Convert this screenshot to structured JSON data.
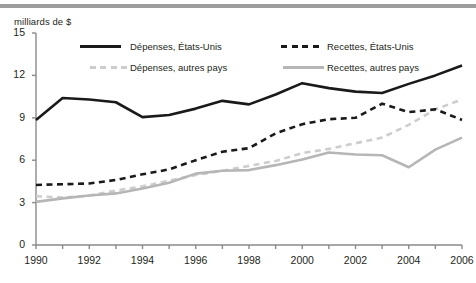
{
  "chart_data": {
    "type": "line",
    "title": "",
    "subtitle": "",
    "ylabel": "milliards de $",
    "xlabel": "",
    "ylim": [
      0,
      15
    ],
    "xlim": [
      1990,
      2006
    ],
    "yticks": [
      0,
      3,
      6,
      9,
      12,
      15
    ],
    "xticks": [
      1990,
      1991,
      1992,
      1993,
      1994,
      1995,
      1996,
      1997,
      1998,
      1999,
      2000,
      2001,
      2002,
      2003,
      2004,
      2005,
      2006
    ],
    "xtick_labels": [
      "1990",
      "1992",
      "1994",
      "1996",
      "1998",
      "2000",
      "2002",
      "2004",
      "2006"
    ],
    "ytick_labels": [
      "0",
      "3",
      "6",
      "9",
      "12",
      "15"
    ],
    "grid": false,
    "legend_position": "top-inside",
    "x": [
      1990,
      1991,
      1992,
      1993,
      1994,
      1995,
      1996,
      1997,
      1998,
      1999,
      2000,
      2001,
      2002,
      2003,
      2004,
      2005,
      2006
    ],
    "series": [
      {
        "name": "Dépenses, États-Unis",
        "style": "solid",
        "color": "#1a1a1a",
        "width": 2.6,
        "values": [
          8.85,
          10.4,
          10.3,
          10.1,
          9.05,
          9.2,
          9.65,
          10.2,
          9.95,
          10.65,
          11.45,
          11.1,
          10.85,
          10.75,
          11.4,
          12.0,
          12.7
        ]
      },
      {
        "name": "Recettes, États-Unis",
        "style": "dashed",
        "color": "#1a1a1a",
        "width": 2.6,
        "values": [
          4.25,
          4.3,
          4.35,
          4.6,
          5.0,
          5.35,
          6.0,
          6.6,
          6.85,
          7.9,
          8.55,
          8.9,
          9.0,
          10.0,
          9.4,
          9.6,
          8.85
        ]
      },
      {
        "name": "Dépenses, autres pays",
        "style": "dashed",
        "color": "#cdcdcd",
        "width": 2.6,
        "values": [
          3.45,
          3.35,
          3.5,
          3.85,
          4.15,
          4.55,
          4.95,
          5.25,
          5.6,
          5.95,
          6.5,
          6.8,
          7.2,
          7.6,
          8.5,
          9.6,
          10.3
        ]
      },
      {
        "name": "Recettes, autres pays",
        "style": "solid",
        "color": "#b6b6b6",
        "width": 2.6,
        "values": [
          3.05,
          3.3,
          3.5,
          3.65,
          4.0,
          4.4,
          5.05,
          5.25,
          5.3,
          5.65,
          6.05,
          6.55,
          6.4,
          6.35,
          5.5,
          6.75,
          7.6
        ]
      }
    ],
    "legend": [
      {
        "label": "Dépenses, États-Unis",
        "color": "#1a1a1a",
        "style": "solid"
      },
      {
        "label": "Recettes, États-Unis",
        "color": "#1a1a1a",
        "style": "dashed"
      },
      {
        "label": "Dépenses, autres pays",
        "color": "#cdcdcd",
        "style": "dashed"
      },
      {
        "label": "Recettes, autres pays",
        "color": "#b6b6b6",
        "style": "solid"
      }
    ],
    "axis_color": "#8a8a8a"
  }
}
